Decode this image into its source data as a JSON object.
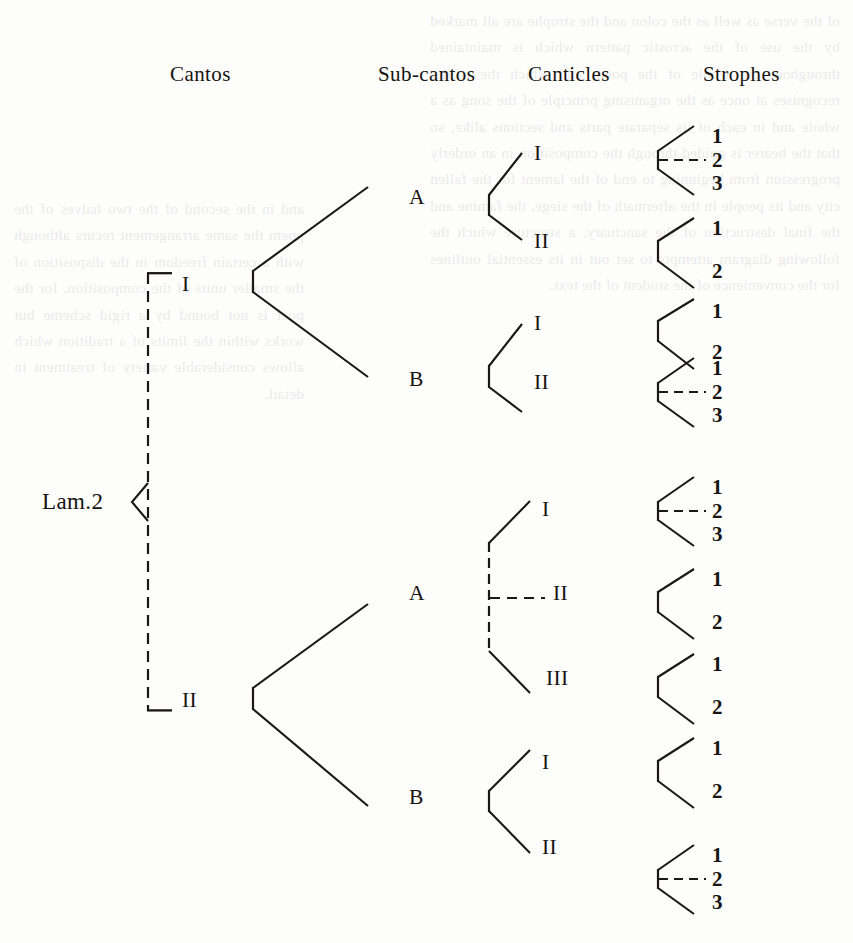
{
  "diagram": {
    "type": "hierarchical-tree",
    "root_label": "Lam.2",
    "headers": [
      {
        "id": "cantos",
        "label": "Cantos",
        "x": 170,
        "y": 62
      },
      {
        "id": "sub-cantos",
        "label": "Sub-cantos",
        "x": 378,
        "y": 62
      },
      {
        "id": "canticles",
        "label": "Canticles",
        "x": 528,
        "y": 62
      },
      {
        "id": "strophes",
        "label": "Strophes",
        "x": 703,
        "y": 62
      }
    ],
    "levels": [
      "Cantos",
      "Sub-cantos",
      "Canticles",
      "Strophes"
    ],
    "cantos": [
      {
        "label": "I",
        "y": 283
      },
      {
        "label": "II",
        "y": 699
      }
    ],
    "sub_cantos": [
      {
        "label": "A",
        "canto": "I",
        "y": 196
      },
      {
        "label": "B",
        "canto": "I",
        "y": 378
      },
      {
        "label": "A",
        "canto": "II",
        "y": 592
      },
      {
        "label": "B",
        "canto": "II",
        "y": 796
      }
    ],
    "canticles": [
      {
        "label": "I",
        "parent": "I.A",
        "y": 152
      },
      {
        "label": "II",
        "parent": "I.A",
        "y": 240
      },
      {
        "label": "I",
        "parent": "I.B",
        "y": 322
      },
      {
        "label": "II",
        "parent": "I.B",
        "y": 381
      },
      {
        "label": "I",
        "parent": "II.A",
        "y": 508
      },
      {
        "label": "II",
        "parent": "II.A",
        "y": 592
      },
      {
        "label": "III",
        "parent": "II.A",
        "y": 677
      },
      {
        "label": "I",
        "parent": "II.B",
        "y": 761
      },
      {
        "label": "II",
        "parent": "II.B",
        "y": 846
      }
    ],
    "strophe_groups": [
      {
        "canticle": "I.A.I",
        "count": 3,
        "values": [
          "1",
          "2",
          "3"
        ],
        "dashed_connector": true,
        "apex_y": 160,
        "label_ys": [
          138,
          160,
          182
        ]
      },
      {
        "canticle": "I.A.II",
        "count": 2,
        "values": [
          "1",
          "2"
        ],
        "dashed_connector": false,
        "apex_y": 250,
        "label_ys": [
          228,
          271
        ]
      },
      {
        "canticle": "I.B.I",
        "count": 2,
        "values": [
          "1",
          "2"
        ],
        "dashed_connector": false,
        "apex_y": 330,
        "label_ys": [
          311,
          352
        ]
      },
      {
        "canticle": "I.B.II",
        "count": 3,
        "values": [
          "1",
          "2",
          "3"
        ],
        "dashed_connector": true,
        "apex_y": 392,
        "label_ys": [
          370,
          392,
          414
        ]
      },
      {
        "canticle": "II.A.I",
        "count": 3,
        "values": [
          "1",
          "2",
          "3"
        ],
        "dashed_connector": true,
        "apex_y": 511,
        "label_ys": [
          489,
          511,
          533
        ]
      },
      {
        "canticle": "II.A.II",
        "count": 2,
        "values": [
          "1",
          "2"
        ],
        "dashed_connector": false,
        "apex_y": 601,
        "label_ys": [
          581,
          622
        ]
      },
      {
        "canticle": "II.A.III",
        "count": 2,
        "values": [
          "1",
          "2"
        ],
        "dashed_connector": false,
        "apex_y": 686,
        "label_ys": [
          666,
          707
        ]
      },
      {
        "canticle": "II.B.I",
        "count": 2,
        "values": [
          "1",
          "2"
        ],
        "dashed_connector": false,
        "apex_y": 770,
        "label_ys": [
          750,
          791
        ]
      },
      {
        "canticle": "II.B.II",
        "count": 3,
        "values": [
          "1",
          "2",
          "3"
        ],
        "dashed_connector": true,
        "apex_y": 879,
        "label_ys": [
          857,
          879,
          901
        ]
      }
    ],
    "notes": {
      "root_brace": "left-pointing angle brace joining the two cantos",
      "canto_bracket": "dashed vertical line with square end-brackets at Canto I and Canto II",
      "dashed_marks": "dashed horizontal tick marks the central element of three-part groups"
    }
  },
  "bleed_text": {
    "right_column": "of the verse as well as the colon and the strophe are all marked by the use of the acrostic pattern which is maintained throughout the whole of the poem and which the reader recognises at once as the organising principle of the song as a whole and in each of its separate parts and sections alike, so that the hearer is guided through the composition in an orderly progression from beginning to end of the lament for the fallen city and its people in the aftermath of the siege, the famine and the final destruction of the sanctuary, a structure which the following diagram attempts to set out in its essential outlines for the convenience of the student of the text.",
    "left_column": "and in the second of the two halves of the poem the same arrangement recurs although with a certain freedom in the disposition of the smaller units of the composition, for the poet is not bound by a rigid scheme but works within the limits of a tradition which allows considerable variety of treatment in detail."
  }
}
